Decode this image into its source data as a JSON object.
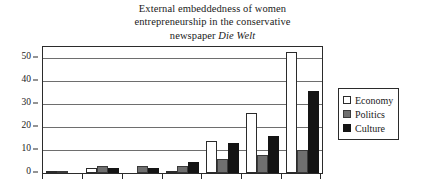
{
  "chart_data": {
    "type": "bar",
    "title": "External embeddedness of women entrepreneurship in the conservative newspaper Die Welt",
    "title_lines": [
      "External embeddedness of women",
      "entrepreneurship in the conservative",
      "newspaper "
    ],
    "title_italic_tail": "Die Welt",
    "xlabel": "",
    "ylabel": "",
    "categories": [
      "1",
      "2",
      "3",
      "4",
      "5",
      "6",
      "7"
    ],
    "series": [
      {
        "name": "Economy",
        "color": "#ffffff",
        "values": [
          1,
          2,
          0,
          1,
          14,
          26,
          53
        ]
      },
      {
        "name": "Politics",
        "color": "#6f6f6f",
        "values": [
          1,
          3,
          3,
          3,
          6,
          8,
          10
        ]
      },
      {
        "name": "Culture",
        "color": "#141414",
        "values": [
          0,
          2,
          2,
          5,
          13,
          16,
          36
        ]
      }
    ],
    "ylim": [
      0,
      55
    ],
    "y_ticks": [
      0,
      10,
      20,
      30,
      40,
      50
    ],
    "grid": true,
    "legend_position": "right"
  },
  "legend": {
    "items": [
      {
        "label": "Economy",
        "swatch": "economy"
      },
      {
        "label": "Politics",
        "swatch": "politics"
      },
      {
        "label": "Culture",
        "swatch": "culture"
      }
    ]
  }
}
